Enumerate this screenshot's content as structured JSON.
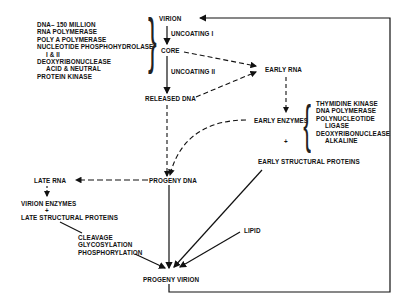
{
  "nodes": {
    "virion": "VIRION",
    "uncoating_1": "UNCOATING I",
    "core": "CORE",
    "uncoating_2": "UNCOATING II",
    "released_dna": "RELEASED DNA",
    "early_rna": "EARLY RNA",
    "early_enzymes": "EARLY ENZYMES",
    "plus_1": "+",
    "early_structural_proteins": "EARLY STRUCTURAL PROTEINS",
    "progeny_dna": "PROGENY DNA",
    "late_rna": "LATE RNA",
    "virion_enzymes": "VIRION ENZYMES",
    "plus_2": "+",
    "late_structural_proteins": "LATE STRUCTURAL PROTEINS",
    "lipid": "LIPID",
    "progeny_virion": "PROGENY VIRION"
  },
  "virion_components": [
    "DNA– 150 MILLION",
    "RNA POLYMERASE",
    "POLY A POLYMERASE",
    "NUCLEOTIDE PHOSPHOHYDROLASE",
    "I & II",
    "DEOXYRIBONUCLEASE",
    "ACID & NEUTRAL",
    "PROTEIN KINASE"
  ],
  "early_enzyme_list": [
    "THYMIDINE  KINASE",
    "DNA POLYMERASE",
    "POLYNUCLEOTIDE",
    "LIGASE",
    "DEOXYRIBONUCLEASE",
    "ALKALINE"
  ],
  "processing_steps": [
    "CLEAVAGE",
    "GLYCOSYLATION",
    "PHOSPHORYLATION"
  ]
}
